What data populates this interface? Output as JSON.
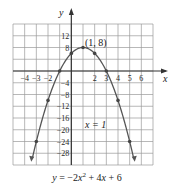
{
  "chart_data": {
    "type": "line",
    "xlabel": "x",
    "ylabel": "y",
    "xlim": [
      -5,
      7
    ],
    "ylim": [
      -32,
      16
    ],
    "grid": true,
    "x_ticks": [
      -4,
      -3,
      -2,
      2,
      3,
      4,
      5,
      6
    ],
    "y_ticks": [
      12,
      8,
      -4,
      -8,
      -12,
      -16,
      -20,
      -24,
      -28
    ],
    "series": [
      {
        "name": "y = −2x² + 4x + 6",
        "points": [
          {
            "x": -3,
            "y": -24
          },
          {
            "x": -2,
            "y": -10
          },
          {
            "x": -1,
            "y": 0
          },
          {
            "x": 0,
            "y": 6
          },
          {
            "x": 1,
            "y": 8
          },
          {
            "x": 2,
            "y": 6
          },
          {
            "x": 3,
            "y": 0
          },
          {
            "x": 4,
            "y": -10
          },
          {
            "x": 5,
            "y": -24
          }
        ]
      }
    ],
    "annotations": [
      {
        "text": "(1, 8)",
        "x": 1,
        "y": 8,
        "label": "vertex"
      },
      {
        "text": "x = 1",
        "label": "axis of symmetry"
      }
    ]
  },
  "labels": {
    "x_axis": "x",
    "y_axis": "y",
    "vertex": "(1, 8)",
    "symmetry": "x = 1",
    "caption_html": "y = −2x² + 4x + 6"
  },
  "colors": {
    "grid": "#9a9a9a",
    "axis": "#333333",
    "curve": "#555555",
    "point": "#444444"
  }
}
